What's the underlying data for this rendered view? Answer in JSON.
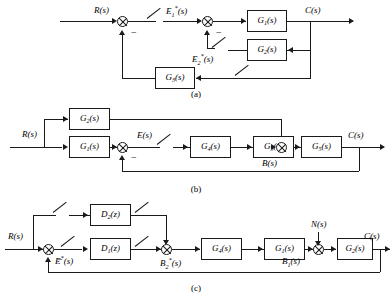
{
  "figure": {
    "captions": [
      {
        "id": "caption-a",
        "text": "(a)"
      },
      {
        "id": "caption-b",
        "text": "(b)"
      },
      {
        "id": "caption-c",
        "text": "(c)"
      }
    ],
    "line_color": "#1a1a1a",
    "background": "#ffffff"
  },
  "diagram_a": {
    "caption": "(a)",
    "input_label": "R(s)",
    "output_label": "C(s)",
    "signals": [
      {
        "name": "error-1",
        "text": "E₁*(s)"
      },
      {
        "name": "error-2",
        "text": "E₂*(s)"
      }
    ],
    "minus_signs": [
      "−",
      "−"
    ],
    "blocks": [
      {
        "name": "block-g1",
        "label": "G₁(s)"
      },
      {
        "name": "block-g2",
        "label": "G₂(s)"
      },
      {
        "name": "block-g3",
        "label": "G₃(s)"
      }
    ],
    "samplers": 3,
    "summing_junctions": 2
  },
  "diagram_b": {
    "caption": "(b)",
    "input_label": "R(s)",
    "output_label": "C(s)",
    "signals": [
      {
        "name": "error",
        "text": "E(s)"
      },
      {
        "name": "feedback-b",
        "text": "B(s)"
      }
    ],
    "minus_signs": [
      "−"
    ],
    "blocks": [
      {
        "name": "block-g2",
        "label": "G₂(s)"
      },
      {
        "name": "block-g1",
        "label": "G₁(s)"
      },
      {
        "name": "block-g4",
        "label": "G₄(s)"
      },
      {
        "name": "block-g3",
        "label": "G₃(s)"
      },
      {
        "name": "block-g5",
        "label": "G₅(s)"
      }
    ],
    "samplers": 1,
    "summing_junctions": 2
  },
  "diagram_c": {
    "caption": "(c)",
    "input_label": "R(s)",
    "output_label": "C(s)",
    "disturbance_label": "N(s)",
    "signals": [
      {
        "name": "error-star",
        "text": "E*(s)"
      },
      {
        "name": "signal-b2",
        "text": "B₂*(s)"
      },
      {
        "name": "signal-b1",
        "text": "B₁(s)"
      }
    ],
    "minus_signs": [
      "−"
    ],
    "blocks": [
      {
        "name": "block-d2",
        "label": "D₂(z)"
      },
      {
        "name": "block-d1",
        "label": "D₁(z)"
      },
      {
        "name": "block-g4",
        "label": "G₄(s)"
      },
      {
        "name": "block-g1",
        "label": "G₁(s)"
      },
      {
        "name": "block-g2",
        "label": "G₂(s)"
      }
    ],
    "samplers": 4,
    "summing_junctions": 3
  }
}
